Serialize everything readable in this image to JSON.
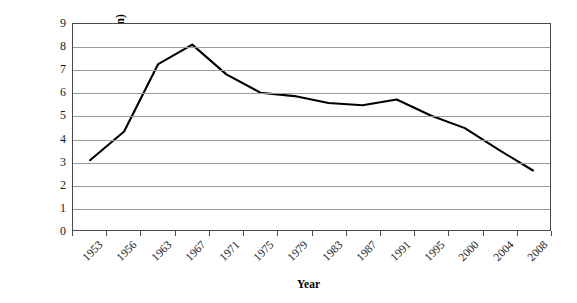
{
  "chart_data": {
    "type": "line",
    "title": "",
    "subtitle": "",
    "xlabel": "Year",
    "ylabel": "Number of members (million)",
    "categories": [
      "1953",
      "1956",
      "1963",
      "1967",
      "1971",
      "1975",
      "1979",
      "1983",
      "1987",
      "1991",
      "1995",
      "2000",
      "2004",
      "2008"
    ],
    "values": [
      3.05,
      4.3,
      7.25,
      8.1,
      6.8,
      6.0,
      5.85,
      5.55,
      5.45,
      5.7,
      5.0,
      4.45,
      3.5,
      2.6
    ],
    "series": [
      {
        "name": "Number of members (million)",
        "values": [
          3.05,
          4.3,
          7.25,
          8.1,
          6.8,
          6.0,
          5.85,
          5.55,
          5.45,
          5.7,
          5.0,
          4.45,
          3.5,
          2.6
        ]
      }
    ],
    "ylim": [
      0,
      9
    ],
    "yticks": [
      0,
      1,
      2,
      3,
      4,
      5,
      6,
      7,
      8,
      9
    ],
    "ytick_labels": [
      "0",
      "1",
      "2",
      "3",
      "4",
      "5",
      "6",
      "7",
      "8",
      "9"
    ],
    "grid": "horizontal",
    "legend": "none",
    "line_color": "#000000",
    "grid_color": "#9a9a9a",
    "axis_color": "#4a4a4a",
    "plot_background": "#ffffff",
    "xtick_label_rotation": -45,
    "markers": false
  },
  "axes": {
    "y_title": "Number of members (million)",
    "x_title": "Year"
  }
}
